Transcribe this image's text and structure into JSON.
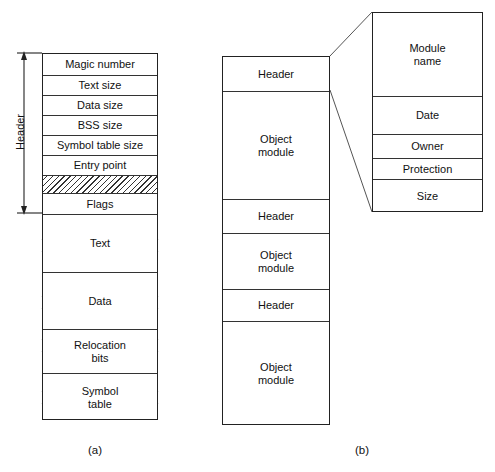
{
  "figure": {
    "caption_a": "(a)",
    "caption_b": "(b)",
    "header_bracket_label": "Header"
  },
  "object_file": {
    "header_rows": [
      {
        "label": "Magic number"
      },
      {
        "label": "Text size"
      },
      {
        "label": "Data size"
      },
      {
        "label": "BSS size"
      },
      {
        "label": "Symbol table size"
      },
      {
        "label": "Entry point"
      },
      {
        "label": ""
      },
      {
        "label": "Flags"
      }
    ],
    "body_rows": [
      {
        "label": "Text"
      },
      {
        "label": "Data"
      },
      {
        "label": "Relocation\nbits"
      },
      {
        "label": "Symbol\ntable"
      }
    ]
  },
  "archive": {
    "rows": [
      {
        "label": "Header"
      },
      {
        "label": "Object\nmodule"
      },
      {
        "label": "Header"
      },
      {
        "label": "Object\nmodule"
      },
      {
        "label": "Header"
      },
      {
        "label": "Object\nmodule"
      }
    ]
  },
  "module_header_detail": {
    "rows": [
      {
        "label": "Module\nname"
      },
      {
        "label": "Date"
      },
      {
        "label": "Owner"
      },
      {
        "label": "Protection"
      },
      {
        "label": "Size"
      }
    ]
  },
  "colors": {
    "stroke": "#222222",
    "divider": "#333333",
    "text": "#111111",
    "background": "#ffffff"
  }
}
